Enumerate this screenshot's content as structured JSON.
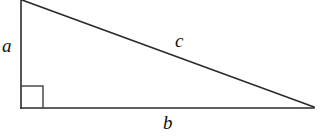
{
  "figure": {
    "kind": "right-triangle-diagram",
    "background_color": "#ffffff",
    "stroke_color": "#2b2b2b",
    "label_color": "#111111",
    "width": 322,
    "height": 136,
    "labels": {
      "vertical_leg": "a",
      "hypotenuse": "c",
      "horizontal_leg": "b"
    },
    "marks": {
      "right_angle_marker": "right-angle-square"
    },
    "geometry": {
      "vertical_leg": {
        "x1": 21,
        "y1": 0,
        "x2": 21,
        "y2": 108
      },
      "horizontal_leg": {
        "x1": 21,
        "y1": 108,
        "x2": 314,
        "y2": 108
      },
      "hypotenuse": {
        "x1": 22,
        "y1": 0,
        "x2": 314,
        "y2": 107
      },
      "right_angle_square": {
        "x": 21,
        "y": 86,
        "size": 22
      }
    }
  }
}
